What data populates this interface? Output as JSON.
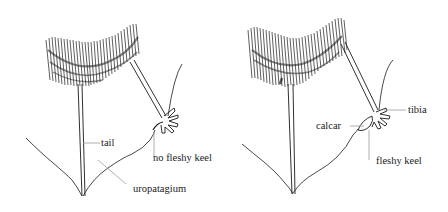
{
  "figures": [
    {
      "id": "left",
      "description": "bat hind limb without fleshy keel",
      "labels": {
        "tail": "tail",
        "keel": "no fleshy keel",
        "uropatagium": "uropatagium"
      }
    },
    {
      "id": "right",
      "description": "bat hind limb with fleshy keel",
      "labels": {
        "tibia": "tibia",
        "calcar": "calcar",
        "keel": "fleshy keel"
      }
    }
  ],
  "colors": {
    "ink": "#1a1a1a",
    "leader": "#9a9a9a",
    "background": "#ffffff"
  }
}
